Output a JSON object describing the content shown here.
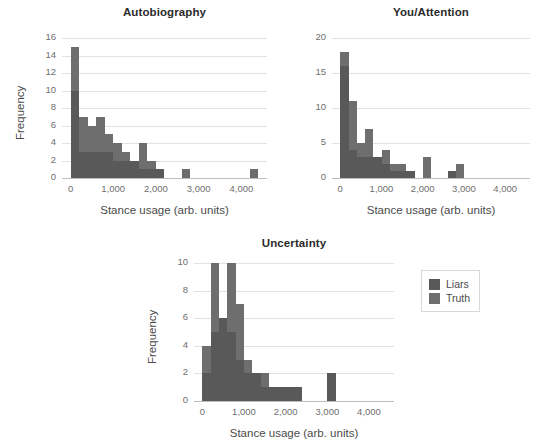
{
  "figure": {
    "legend": {
      "entries": [
        {
          "label": "Liars",
          "color": "#595959"
        },
        {
          "label": "Truth",
          "color": "#6e6e6e"
        }
      ]
    }
  },
  "chart_data": [
    {
      "type": "bar",
      "title": "Autobiography",
      "xlabel": "Stance usage (arb. units)",
      "ylabel": "Frequency",
      "xlim": [
        -200,
        4600
      ],
      "ylim": [
        0,
        16
      ],
      "xticks": [
        0,
        1000,
        2000,
        3000,
        4000
      ],
      "xticklabels": [
        "0",
        "1,000",
        "2,000",
        "3,000",
        "4,000"
      ],
      "yticks": [
        0,
        2,
        4,
        6,
        8,
        10,
        12,
        14,
        16
      ],
      "yticklabels": [
        "0",
        "2",
        "4",
        "6",
        "8",
        "10",
        "12",
        "14",
        "16"
      ],
      "grid": true,
      "bin_width": 200,
      "bin_starts": [
        0,
        200,
        400,
        600,
        800,
        1000,
        1200,
        1400,
        1600,
        1800,
        2000,
        2600,
        4200
      ],
      "series": [
        {
          "name": "Liars",
          "color": "#595959",
          "values": [
            10,
            3,
            3,
            3,
            3,
            2,
            2,
            2,
            1,
            1,
            1,
            0,
            0
          ]
        },
        {
          "name": "Truth",
          "color": "#6e6e6e",
          "values": [
            15,
            7,
            6,
            7,
            5,
            4,
            3,
            2,
            4,
            2,
            1,
            1,
            1
          ]
        }
      ]
    },
    {
      "type": "bar",
      "title": "You/Attention",
      "xlabel": "Stance usage (arb. units)",
      "ylabel": "",
      "xlim": [
        -200,
        4600
      ],
      "ylim": [
        0,
        20
      ],
      "xticks": [
        0,
        1000,
        2000,
        3000,
        4000
      ],
      "xticklabels": [
        "0",
        "1,000",
        "2,000",
        "3,000",
        "4,000"
      ],
      "yticks": [
        0,
        5,
        10,
        15,
        20
      ],
      "yticklabels": [
        "0",
        "5",
        "10",
        "15",
        "20"
      ],
      "grid": true,
      "bin_width": 200,
      "bin_starts": [
        0,
        200,
        400,
        600,
        800,
        1000,
        1200,
        1400,
        1600,
        2000,
        2600,
        2800
      ],
      "series": [
        {
          "name": "Liars",
          "color": "#595959",
          "values": [
            16,
            4,
            3,
            3,
            3,
            2,
            1,
            1,
            1,
            0,
            1,
            0
          ]
        },
        {
          "name": "Truth",
          "color": "#6e6e6e",
          "values": [
            18,
            11,
            5,
            7,
            3,
            4,
            2,
            2,
            1,
            3,
            1,
            2
          ]
        }
      ]
    },
    {
      "type": "bar",
      "title": "Uncertainty",
      "xlabel": "Stance usage (arb. units)",
      "ylabel": "Frequency",
      "xlim": [
        -200,
        4600
      ],
      "ylim": [
        0,
        10
      ],
      "xticks": [
        0,
        1000,
        2000,
        3000,
        4000
      ],
      "xticklabels": [
        "0",
        "1,000",
        "2,000",
        "3,000",
        "4,000"
      ],
      "yticks": [
        0,
        2,
        4,
        6,
        8,
        10
      ],
      "yticklabels": [
        "0",
        "2",
        "4",
        "6",
        "8",
        "10"
      ],
      "grid": true,
      "bin_width": 200,
      "bin_starts": [
        0,
        200,
        400,
        600,
        800,
        1000,
        1200,
        1400,
        1600,
        1800,
        2000,
        2200,
        3000
      ],
      "series": [
        {
          "name": "Liars",
          "color": "#595959",
          "values": [
            2,
            5,
            6,
            5,
            3,
            2,
            2,
            1,
            1,
            1,
            1,
            1,
            2
          ]
        },
        {
          "name": "Truth",
          "color": "#6e6e6e",
          "values": [
            4,
            10,
            6,
            10,
            7,
            3,
            2,
            2,
            1,
            1,
            1,
            1,
            0
          ]
        }
      ]
    }
  ]
}
